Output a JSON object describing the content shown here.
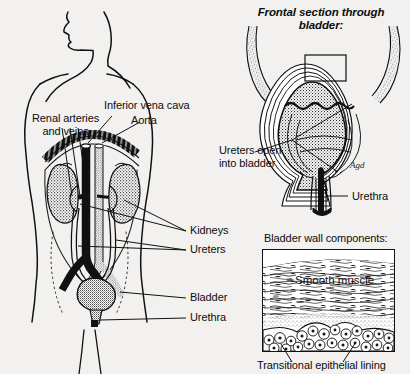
{
  "figure": {
    "title_main": "Urinary system anatomy",
    "background_color": "#f2f1ef",
    "ink_color": "#111111"
  },
  "torso_panel": {
    "name": "anterior torso with urinary system",
    "labels": {
      "renal": "Renal arteries\nand veins",
      "renal_line1": "Renal arteries",
      "renal_line2": "and veins",
      "vena_cava": "Inferior vena cava",
      "aorta": "Aorta",
      "kidneys": "Kidneys",
      "ureters": "Ureters",
      "bladder": "Bladder",
      "urethra": "Urethra"
    }
  },
  "frontal_panel": {
    "title_line1": "Frontal section through",
    "title_line2": "bladder:",
    "labels": {
      "ureters_open_line1": "Ureters open",
      "ureters_open_line2": "into bladder",
      "urethra": "Urethra"
    },
    "signature": "Agd"
  },
  "wall_panel": {
    "heading": "Bladder wall components:",
    "inner_label": "Smooth muscle",
    "caption": "Transitional epithelial lining"
  }
}
